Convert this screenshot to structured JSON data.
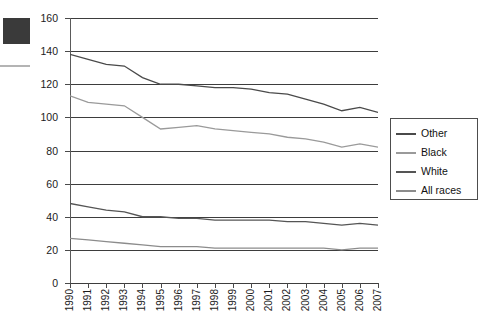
{
  "chart_data": {
    "type": "line",
    "title": "",
    "xlabel": "",
    "ylabel": "",
    "ylim": [
      0,
      160
    ],
    "ytick_labels": [
      "160",
      "140",
      "120",
      "100",
      "80",
      "60",
      "40",
      "20",
      "0"
    ],
    "ytick_values": [
      160,
      140,
      120,
      100,
      80,
      60,
      40,
      20,
      0
    ],
    "grid": true,
    "grid_axis": "y",
    "legend_position": "right",
    "categories": [
      "1990",
      "1991",
      "1992",
      "1993",
      "1994",
      "1995",
      "1996",
      "1997",
      "1998",
      "1999",
      "2000",
      "2001",
      "2002",
      "2003",
      "2004",
      "2005",
      "2006",
      "2007"
    ],
    "series": [
      {
        "name": "Other",
        "color": "#4a4a4a",
        "values": [
          138,
          135,
          132,
          131,
          124,
          120,
          120,
          119,
          118,
          118,
          117,
          115,
          114,
          111,
          108,
          104,
          106,
          103
        ]
      },
      {
        "name": "Black",
        "color": "#9a9a9a",
        "values": [
          113,
          109,
          108,
          107,
          100,
          93,
          94,
          95,
          93,
          92,
          91,
          90,
          88,
          87,
          85,
          82,
          84,
          82
        ]
      },
      {
        "name": "White",
        "color": "#555555",
        "values": [
          48,
          46,
          44,
          43,
          40,
          40,
          39,
          39,
          38,
          38,
          38,
          38,
          37,
          37,
          36,
          35,
          36,
          35
        ]
      },
      {
        "name": "All races",
        "color": "#8c8c8c",
        "values": [
          27,
          26,
          25,
          24,
          23,
          22,
          22,
          22,
          21,
          21,
          21,
          21,
          21,
          21,
          21,
          20,
          21,
          21
        ]
      }
    ]
  },
  "legend": {
    "items": [
      {
        "label": "Other"
      },
      {
        "label": "Black"
      },
      {
        "label": "White"
      },
      {
        "label": "All races"
      }
    ]
  }
}
